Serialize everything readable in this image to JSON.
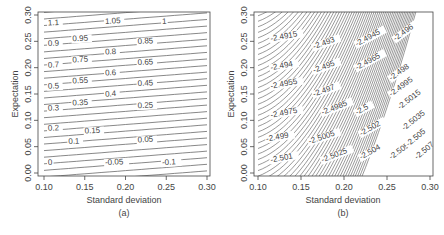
{
  "chart_data": [
    {
      "type": "contour",
      "panel_label": "(a)",
      "xlabel": "Standard deviation",
      "ylabel": "Expectation",
      "xlim": [
        0.1,
        0.3
      ],
      "ylim": [
        0.0,
        0.3
      ],
      "x_ticks": [
        "0.10",
        "0.15",
        "0.20",
        "0.25",
        "0.30"
      ],
      "y_ticks": [
        "0.00",
        "0.05",
        "0.10",
        "0.15",
        "0.20",
        "0.25",
        "0.30"
      ],
      "grid": false,
      "contour_levels": [
        "1.1",
        "1.05",
        "1",
        "0.95",
        "0.9",
        "0.85",
        "0.8",
        "0.75",
        "0.7",
        "0.65",
        "0.6",
        "0.55",
        "0.5",
        "0.45",
        "0.4",
        "0.35",
        "0.3",
        "0.25",
        "0.2",
        "0.15",
        "0.1",
        "0.05",
        "0",
        "-0.05",
        "-0.1"
      ],
      "labels": [
        {
          "text": "1.1",
          "x": 0.105,
          "y": 0.28
        },
        {
          "text": "1.05",
          "x": 0.175,
          "y": 0.283
        },
        {
          "text": "1",
          "x": 0.245,
          "y": 0.283
        },
        {
          "text": "0.95",
          "x": 0.135,
          "y": 0.25
        },
        {
          "text": "0.9",
          "x": 0.105,
          "y": 0.241
        },
        {
          "text": "0.85",
          "x": 0.215,
          "y": 0.245
        },
        {
          "text": "0.8",
          "x": 0.175,
          "y": 0.225
        },
        {
          "text": "0.75",
          "x": 0.135,
          "y": 0.21
        },
        {
          "text": "0.7",
          "x": 0.105,
          "y": 0.2
        },
        {
          "text": "0.65",
          "x": 0.215,
          "y": 0.205
        },
        {
          "text": "0.6",
          "x": 0.175,
          "y": 0.185
        },
        {
          "text": "0.55",
          "x": 0.135,
          "y": 0.17
        },
        {
          "text": "0.5",
          "x": 0.105,
          "y": 0.16
        },
        {
          "text": "0.45",
          "x": 0.215,
          "y": 0.165
        },
        {
          "text": "0.4",
          "x": 0.175,
          "y": 0.145
        },
        {
          "text": "0.35",
          "x": 0.135,
          "y": 0.128
        },
        {
          "text": "0.3",
          "x": 0.105,
          "y": 0.118
        },
        {
          "text": "0.25",
          "x": 0.215,
          "y": 0.123
        },
        {
          "text": "0.2",
          "x": 0.105,
          "y": 0.08
        },
        {
          "text": "0.15",
          "x": 0.15,
          "y": 0.075
        },
        {
          "text": "0.1",
          "x": 0.13,
          "y": 0.055
        },
        {
          "text": "0.05",
          "x": 0.215,
          "y": 0.058
        },
        {
          "text": "0",
          "x": 0.105,
          "y": 0.015
        },
        {
          "text": "-0.05",
          "x": 0.175,
          "y": 0.015
        },
        {
          "text": "-0.1",
          "x": 0.245,
          "y": 0.015
        }
      ]
    },
    {
      "type": "contour",
      "panel_label": "(b)",
      "xlabel": "Standard deviation",
      "ylabel": "Expectation",
      "xlim": [
        0.1,
        0.3
      ],
      "ylim": [
        0.0,
        0.3
      ],
      "x_ticks": [
        "0.10",
        "0.15",
        "0.20",
        "0.25",
        "0.30"
      ],
      "y_ticks": [
        "0.00",
        "0.05",
        "0.10",
        "0.15",
        "0.20",
        "0.25",
        "0.30"
      ],
      "grid": false,
      "contour_levels": [
        "-2.4915",
        "-2.493",
        "-2.494",
        "-2.4945",
        "-2.495",
        "-2.4955",
        "-2.496",
        "-2.4965",
        "-2.497",
        "-2.4975",
        "-2.498",
        "-2.4985",
        "-2.499",
        "-2.4995",
        "-2.5",
        "-2.5005",
        "-2.501",
        "-2.5015",
        "-2.502",
        "-2.5025",
        "-2.5035",
        "-2.504",
        "-2.505",
        "-2.5055",
        "-2.507"
      ],
      "labels": [
        {
          "text": "-2.4915",
          "x": 0.115,
          "y": 0.25
        },
        {
          "text": "-2.493",
          "x": 0.165,
          "y": 0.235
        },
        {
          "text": "-2.4945",
          "x": 0.215,
          "y": 0.24
        },
        {
          "text": "-2.496",
          "x": 0.26,
          "y": 0.25
        },
        {
          "text": "-2.494",
          "x": 0.115,
          "y": 0.195
        },
        {
          "text": "-2.495",
          "x": 0.165,
          "y": 0.19
        },
        {
          "text": "-2.4965",
          "x": 0.215,
          "y": 0.195
        },
        {
          "text": "-2.498",
          "x": 0.255,
          "y": 0.175
        },
        {
          "text": "-2.4955",
          "x": 0.115,
          "y": 0.16
        },
        {
          "text": "-2.497",
          "x": 0.165,
          "y": 0.145
        },
        {
          "text": "-2.4995",
          "x": 0.255,
          "y": 0.145
        },
        {
          "text": "-2.4975",
          "x": 0.115,
          "y": 0.105
        },
        {
          "text": "-2.4985",
          "x": 0.175,
          "y": 0.11
        },
        {
          "text": "-2.5",
          "x": 0.215,
          "y": 0.11
        },
        {
          "text": "-2.5015",
          "x": 0.265,
          "y": 0.12
        },
        {
          "text": "-2.499",
          "x": 0.11,
          "y": 0.06
        },
        {
          "text": "-2.5005",
          "x": 0.16,
          "y": 0.055
        },
        {
          "text": "-2.502",
          "x": 0.22,
          "y": 0.07
        },
        {
          "text": "-2.5035",
          "x": 0.27,
          "y": 0.08
        },
        {
          "text": "-2.501",
          "x": 0.115,
          "y": 0.02
        },
        {
          "text": "-2.5025",
          "x": 0.175,
          "y": 0.02
        },
        {
          "text": "-2.504",
          "x": 0.22,
          "y": 0.025
        },
        {
          "text": "-2.5055",
          "x": 0.255,
          "y": 0.025
        },
        {
          "text": "-2.505",
          "x": 0.275,
          "y": 0.05
        },
        {
          "text": "-2.507",
          "x": 0.285,
          "y": 0.025
        }
      ]
    }
  ],
  "figure": {
    "panel_a_label": "(a)",
    "panel_b_label": "(b)",
    "xlabel": "Standard deviation",
    "ylabel": "Expectation",
    "x_ticks": [
      "0.10",
      "0.15",
      "0.20",
      "0.25",
      "0.30"
    ],
    "y_ticks": [
      "0.00",
      "0.05",
      "0.10",
      "0.15",
      "0.20",
      "0.25",
      "0.30"
    ]
  }
}
